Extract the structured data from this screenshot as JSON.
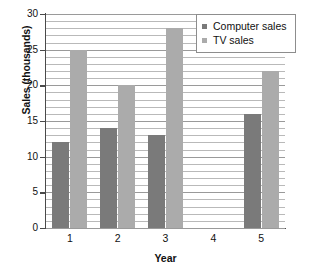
{
  "chart_data": {
    "type": "bar",
    "title": "",
    "xlabel": "Year",
    "ylabel": "Sales (thousands)",
    "categories": [
      "1",
      "2",
      "3",
      "4",
      "5"
    ],
    "series": [
      {
        "name": "Computer sales",
        "values": [
          12,
          14,
          13,
          0,
          16
        ],
        "color": "#7a7a7a"
      },
      {
        "name": "TV sales",
        "values": [
          25,
          20,
          28,
          0,
          22
        ],
        "color": "#ababab"
      }
    ],
    "ylim": [
      0,
      30
    ],
    "ytick_labels": [
      "0",
      "5",
      "10",
      "15",
      "20",
      "25",
      "30"
    ],
    "ytick_values": [
      0,
      5,
      10,
      15,
      20,
      25,
      30
    ],
    "minor_gridline_step": 1,
    "grid": true,
    "legend_position": "top-right"
  },
  "legend": {
    "entries": [
      {
        "label": "Computer sales"
      },
      {
        "label": "TV sales"
      }
    ]
  },
  "colors": {
    "computer_sales": "#7a7a7a",
    "tv_sales": "#ababab",
    "axis": "#4a4a4a",
    "gridline": "#b9b9b9",
    "legend_border": "#8d8d8d",
    "text": "#111111",
    "background": "#ffffff"
  }
}
